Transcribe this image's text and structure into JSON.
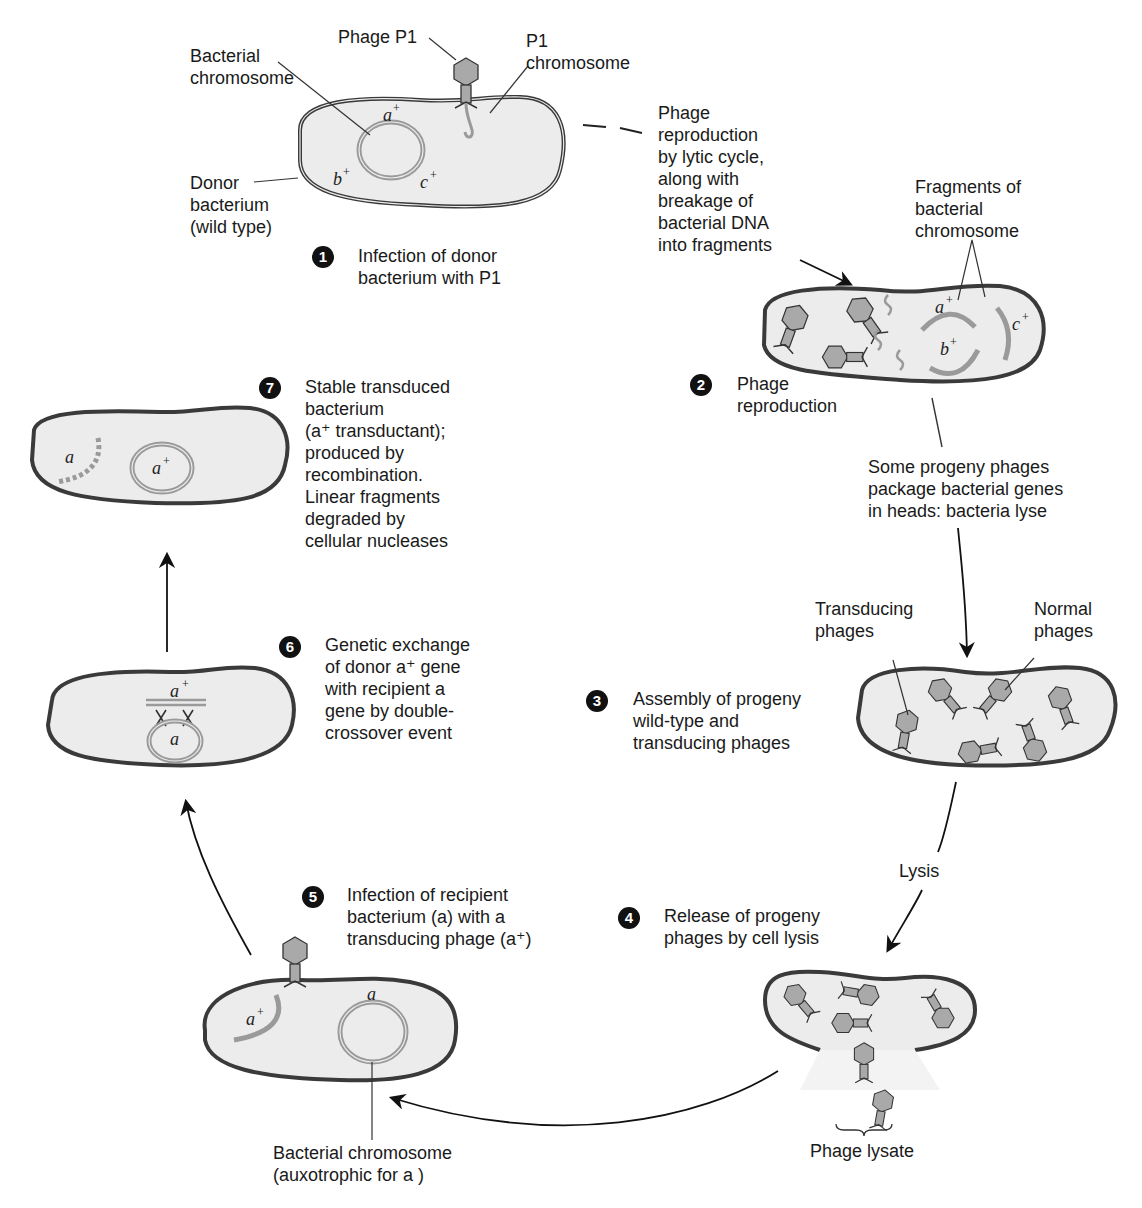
{
  "diagram": {
    "type": "biological-process-cycle",
    "topic": "Generalized transduction by phage P1",
    "colors": {
      "cell_fill": "#ececec",
      "cell_wall": "#3a3a3a",
      "chromosome": "#9a9a9a",
      "phage_fill": "#a9a9a9",
      "text": "#1a1a1a",
      "step_badge": "#111111"
    }
  },
  "labels": {
    "phage_p1": "Phage P1",
    "p1_chromosome": "P1\nchromosome",
    "bacterial_chromosome": "Bacterial\nchromosome",
    "donor_bacterium": "Donor\nbacterium\n(wild type)",
    "lytic_note": "Phage\nreproduction\nby lytic cycle,\nalong with\nbreakage of\nbacterial DNA\ninto fragments",
    "fragments": "Fragments of\nbacterial\nchromosome",
    "package_note": "Some progeny phages\npackage bacterial genes\nin heads: bacteria lyse",
    "transducing_phages": "Transducing\nphages",
    "normal_phages": "Normal\nphages",
    "lysis": "Lysis",
    "phage_lysate": "Phage lysate",
    "recipient_chromosome": "Bacterial chromosome\n(auxotrophic for a )"
  },
  "genes": {
    "a_plus": "a",
    "b_plus": "b",
    "c_plus": "c",
    "a": "a",
    "plus": "+"
  },
  "steps": [
    {
      "num": "1",
      "text": "Infection of donor\nbacterium with P1"
    },
    {
      "num": "2",
      "text": "Phage\nreproduction"
    },
    {
      "num": "3",
      "text": "Assembly of progeny\nwild-type and\ntransducing phages"
    },
    {
      "num": "4",
      "text": "Release of progeny\nphages by cell lysis"
    },
    {
      "num": "5",
      "text": "Infection of recipient\nbacterium (a) with a\ntransducing phage (a⁺)"
    },
    {
      "num": "6",
      "text": "Genetic exchange\nof donor a⁺ gene\nwith recipient a\ngene by double-\ncrossover event"
    },
    {
      "num": "7",
      "text": "Stable transduced\nbacterium\n(a⁺ transductant);\nproduced by\nrecombination.\nLinear fragments\ndegraded by\ncellular nucleases"
    }
  ]
}
